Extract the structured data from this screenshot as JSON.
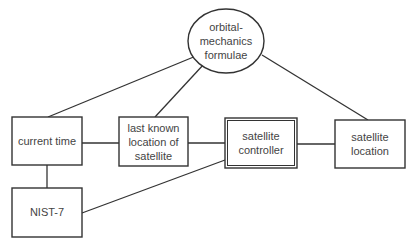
{
  "diagram": {
    "type": "entity-relationship",
    "colors": {
      "stroke": "#333333",
      "text": "#444444",
      "background": "#ffffff"
    },
    "nodes": {
      "formulae": {
        "shape": "ellipse",
        "lines": [
          "orbital-",
          "mechanics",
          "formulae"
        ]
      },
      "current_time": {
        "shape": "box",
        "lines": [
          "current time"
        ]
      },
      "last_known": {
        "shape": "box",
        "lines": [
          "last known",
          "location of",
          "satellite"
        ]
      },
      "controller": {
        "shape": "double-box",
        "lines": [
          "satellite",
          "controller"
        ]
      },
      "sat_location": {
        "shape": "box",
        "lines": [
          "satellite",
          "location"
        ]
      },
      "nist": {
        "shape": "box",
        "lines": [
          "NIST-7"
        ]
      }
    },
    "edges": [
      {
        "from": "formulae",
        "to": "current_time"
      },
      {
        "from": "formulae",
        "to": "last_known"
      },
      {
        "from": "formulae",
        "to": "sat_location"
      },
      {
        "from": "current_time",
        "to": "last_known"
      },
      {
        "from": "last_known",
        "to": "controller"
      },
      {
        "from": "controller",
        "to": "sat_location"
      },
      {
        "from": "current_time",
        "to": "nist"
      },
      {
        "from": "nist",
        "to": "controller"
      }
    ]
  }
}
